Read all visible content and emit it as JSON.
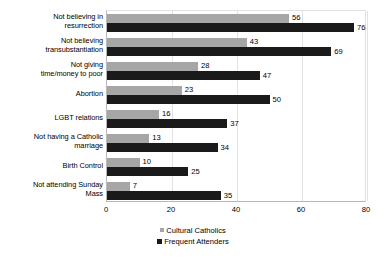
{
  "chart_data": {
    "type": "bar",
    "orientation": "horizontal",
    "title": "",
    "subtitle": "",
    "xlabel": "",
    "ylabel": "",
    "xlim": [
      0,
      80
    ],
    "xticks": [
      0,
      20,
      40,
      60,
      80
    ],
    "grid": true,
    "legend_position": "bottom",
    "categories": [
      "Not believing in resurrection",
      "Not believing transubstantiation",
      "Not giving time/money to poor",
      "Abortion",
      "LGBT relations",
      "Not having a Catholic marriage",
      "Birth Control",
      "Not attending Sunday Mass"
    ],
    "category_lines": [
      [
        "Not believing in",
        "resurrection"
      ],
      [
        "Not believing",
        "transubstantiation"
      ],
      [
        "Not giving",
        "time/money to poor"
      ],
      [
        "Abortion"
      ],
      [
        "LGBT relations"
      ],
      [
        "Not having a Catholic",
        "marriage"
      ],
      [
        "Birth Control"
      ],
      [
        "Not attending Sunday",
        "Mass"
      ]
    ],
    "series": [
      {
        "name": "Cultural Catholics",
        "color": "#a6a6a6",
        "values": [
          56,
          43,
          28,
          23,
          16,
          13,
          10,
          7
        ]
      },
      {
        "name": "Frequent Attenders",
        "color": "#1a1a1a",
        "values": [
          76,
          69,
          47,
          50,
          37,
          34,
          25,
          35
        ]
      }
    ]
  },
  "legend": {
    "items": [
      {
        "label": "Cultural Catholics",
        "marker": "square-gray"
      },
      {
        "label": "Frequent Attenders",
        "marker": "square-black"
      }
    ]
  }
}
